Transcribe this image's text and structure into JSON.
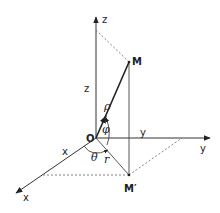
{
  "diagram": {
    "axes": {
      "z": {
        "label": "z"
      },
      "y": {
        "label": "y"
      },
      "x": {
        "label": "x"
      }
    },
    "points": {
      "origin": {
        "label": "O"
      },
      "M": {
        "label": "M"
      },
      "M_proj": {
        "label": "M′"
      }
    },
    "segment_labels": {
      "z_height": "z",
      "y_coord": "y",
      "x_coord": "x",
      "rho": "ρ",
      "r": "r"
    },
    "angles": {
      "phi": "φ",
      "theta": "θ"
    },
    "colors": {
      "line": "#222222",
      "dashed": "#777777",
      "background": "#ffffff"
    }
  }
}
